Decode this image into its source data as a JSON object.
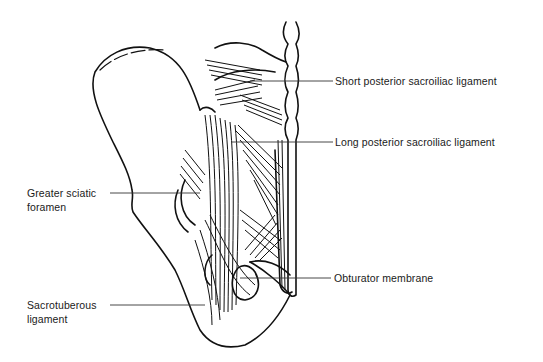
{
  "figure": {
    "line_color": "#111111",
    "background": "#ffffff"
  },
  "labels": {
    "short_posterior_sacroiliac": {
      "text": "Short posterior sacroiliac ligament",
      "side": "right"
    },
    "long_posterior_sacroiliac": {
      "text": "Long posterior sacroiliac ligament",
      "side": "right"
    },
    "greater_sciatic_foramen": {
      "line1": "Greater sciatic",
      "line2": "foramen",
      "side": "left"
    },
    "obturator_membrane": {
      "text": "Obturator membrane",
      "side": "right"
    },
    "sacrotuberous_ligament": {
      "line1": "Sacrotuberous",
      "line2": "ligament",
      "side": "left"
    }
  }
}
